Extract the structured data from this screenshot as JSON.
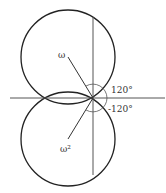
{
  "diagram": {
    "labels": {
      "omega": "ω",
      "omega_sq": "ω²",
      "angle_upper": "120°",
      "angle_lower": "-120°"
    },
    "colors": {
      "stroke": "#222222",
      "background": "#ffffff"
    }
  }
}
